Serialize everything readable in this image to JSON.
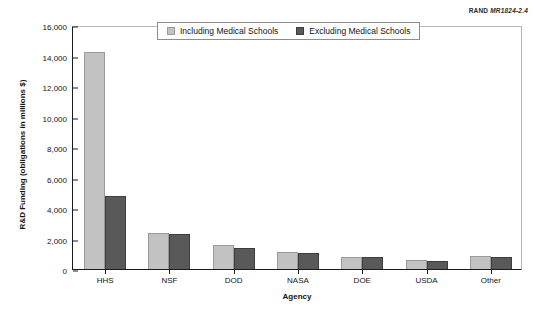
{
  "source_credit": {
    "prefix": "RAND",
    "code": "MR1824-2.4"
  },
  "legend": {
    "position": "top-center-inside",
    "entries": [
      {
        "label": "Including Medical Schools",
        "color": "#c2c2c2"
      },
      {
        "label": "Excluding Medical Schools",
        "color": "#595959"
      }
    ]
  },
  "chart_data": {
    "type": "bar",
    "title": "",
    "xlabel": "Agency",
    "ylabel": "R&D Funding (obligations in millions $)",
    "categories": [
      "HHS",
      "NSF",
      "DOD",
      "NASA",
      "DOE",
      "USDA",
      "Other"
    ],
    "series": [
      {
        "name": "Including Medical Schools",
        "color": "#c2c2c2",
        "values": [
          14200,
          2350,
          1550,
          1100,
          800,
          600,
          850
        ]
      },
      {
        "name": "Excluding Medical Schools",
        "color": "#595959",
        "values": [
          4800,
          2300,
          1400,
          1050,
          800,
          550,
          800
        ]
      }
    ],
    "ylim": [
      0,
      16000
    ],
    "ytick_step": 2000,
    "yticks": [
      0,
      2000,
      4000,
      6000,
      8000,
      10000,
      12000,
      14000,
      16000
    ],
    "ytick_labels": [
      "0",
      "2,000",
      "4,000",
      "6,000",
      "8,000",
      "10,000",
      "12,000",
      "14,000",
      "16,000"
    ],
    "grid": false,
    "legend_position": "top-center"
  }
}
